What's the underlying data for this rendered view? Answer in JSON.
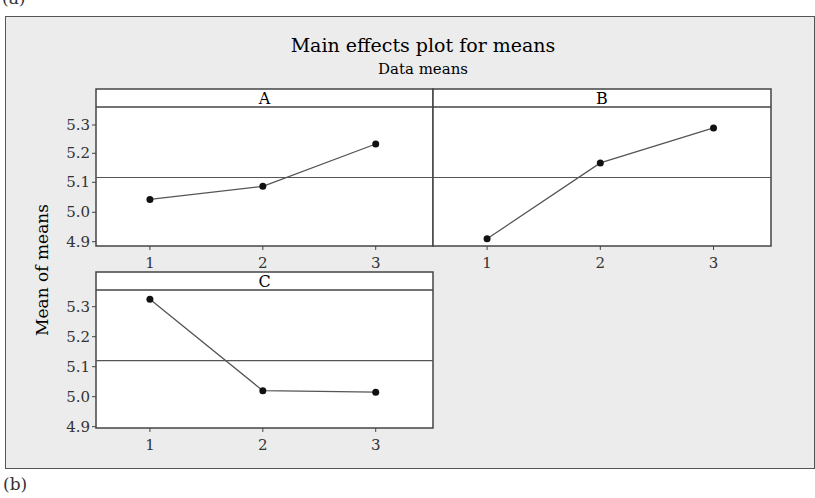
{
  "figure": {
    "top_label": "(a)",
    "bottom_label": "(b)"
  },
  "chart_data": {
    "type": "line",
    "title": "Main effects plot for means",
    "subtitle": "Data means",
    "ylabel": "Mean of means",
    "xlabel": "",
    "ylim": [
      4.9,
      5.36
    ],
    "yticks": [
      "4.9",
      "5.0",
      "5.1",
      "5.2",
      "5.3"
    ],
    "xticks": [
      "1",
      "2",
      "3"
    ],
    "grand_mean": 5.12,
    "grid": false,
    "panels": [
      {
        "name": "A",
        "x": [
          1,
          2,
          3
        ],
        "values": [
          5.045,
          5.09,
          5.235
        ]
      },
      {
        "name": "B",
        "x": [
          1,
          2,
          3
        ],
        "values": [
          4.91,
          5.17,
          5.29
        ]
      },
      {
        "name": "C",
        "x": [
          1,
          2,
          3
        ],
        "values": [
          5.325,
          5.02,
          5.015
        ]
      }
    ]
  }
}
